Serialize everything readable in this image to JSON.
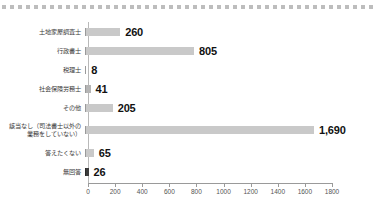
{
  "decor": {
    "dotted_rule": {
      "name": "dotted-rule",
      "dot_count": 47,
      "color": "#bdbdbd"
    }
  },
  "chart_data": {
    "type": "bar",
    "orientation": "horizontal",
    "title": "",
    "subtitle": "",
    "xlabel": "",
    "ylabel": "",
    "xlim": [
      0,
      1800
    ],
    "xticks": [
      0,
      200,
      400,
      600,
      800,
      1000,
      1200,
      1400,
      1600,
      1800
    ],
    "xtick_labels": [
      "0",
      "200",
      "400",
      "600",
      "800",
      "1000",
      "1200",
      "1400",
      "1600",
      "1800"
    ],
    "grid": false,
    "legend": null,
    "bar_color": "#c9c9c9",
    "highlight_color": "#3d3d3d",
    "categories": [
      "土地家屋調査士",
      "行政書士",
      "税理士",
      "社会保険労務士",
      "その他",
      "該当なし（司法書士以外の\n業務をしていない）",
      "答えたくない",
      "無回答"
    ],
    "values": [
      260,
      805,
      8,
      41,
      205,
      1690,
      65,
      26
    ],
    "value_labels": [
      "260",
      "805",
      "8",
      "41",
      "205",
      "1,690",
      "65",
      "26"
    ],
    "bars": [
      {
        "category": "土地家屋調査士",
        "value": 260,
        "label": "260",
        "color": "#c9c9c9"
      },
      {
        "category": "行政書士",
        "value": 805,
        "label": "805",
        "color": "#c9c9c9"
      },
      {
        "category": "税理士",
        "value": 8,
        "label": "8",
        "color": "#b5b5b5"
      },
      {
        "category": "社会保険労務士",
        "value": 41,
        "label": "41",
        "color": "#b5b5b5"
      },
      {
        "category": "その他",
        "value": 205,
        "label": "205",
        "color": "#c9c9c9"
      },
      {
        "category": "該当なし（司法書士以外の\n業務をしていない）",
        "value": 1690,
        "label": "1,690",
        "color": "#c9c9c9"
      },
      {
        "category": "答えたくない",
        "value": 65,
        "label": "65",
        "color": "#c9c9c9"
      },
      {
        "category": "無回答",
        "value": 26,
        "label": "26",
        "color": "#3d3d3d"
      }
    ]
  }
}
